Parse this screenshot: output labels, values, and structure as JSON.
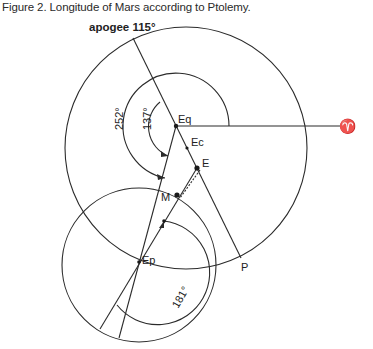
{
  "figure": {
    "caption": "Figure 2. Longitude of Mars according to Ptolemy.",
    "labels": {
      "apogee": "apogee 115°",
      "eq": "Eq",
      "ec": "Ec",
      "e": "E",
      "m": "M",
      "ep": "Ep",
      "p": "P",
      "aries": "♈",
      "angle_252": "252°",
      "angle_137": "137°",
      "angle_181": "181°"
    },
    "colors": {
      "line": "#2b2b2b",
      "background": "#ffffff"
    }
  }
}
